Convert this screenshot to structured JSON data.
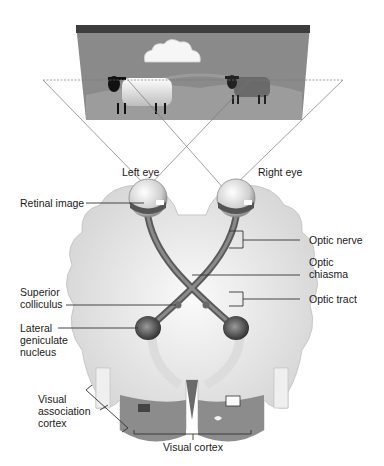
{
  "diagram": {
    "labels": {
      "left_eye": "Left eye",
      "right_eye": "Right eye",
      "retinal_image": "Retinal image",
      "optic_nerve": "Optic nerve",
      "optic_chiasma_1": "Optic",
      "optic_chiasma_2": "chiasma",
      "optic_tract": "Optic tract",
      "superior_colliculus_1": "Superior",
      "superior_colliculus_2": "colliculus",
      "lateral_geniculate_1": "Lateral",
      "lateral_geniculate_2": "geniculate",
      "lateral_geniculate_3": "nucleus",
      "visual_association_1": "Visual",
      "visual_association_2": "association",
      "visual_association_3": "cortex",
      "visual_cortex": "Visual cortex"
    },
    "scene": {
      "objects": [
        "cloud",
        "sheep-white",
        "sheep-dark",
        "hills"
      ]
    },
    "colors": {
      "scene_bg": "#8a8a8a",
      "scene_top": "#3c3c3c",
      "brain": "#e6e6e6",
      "nerve": "#6b6b6b",
      "cortex": "#8c8c8c"
    }
  }
}
